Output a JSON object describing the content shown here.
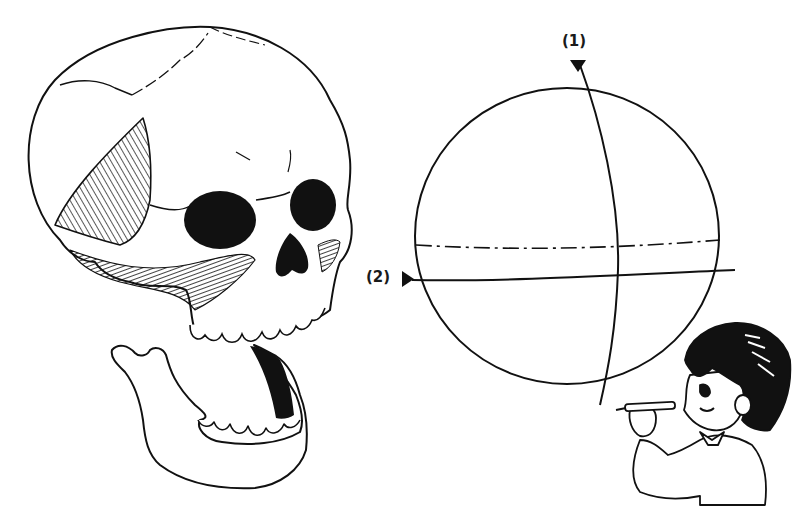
{
  "figure": {
    "type": "illustration",
    "style": "black ink line drawing on white",
    "background": "#ffffff",
    "ink_color": "#111111"
  },
  "labels": {
    "axis1": "(1)",
    "axis2": "(2)"
  },
  "elements": {
    "skull": "human skull, three-quarter view, with open detached jaw",
    "mandible": "lower jaw with teeth, separated below skull",
    "sphere": "circle representing head as a ball with two axis lines",
    "axis1_line": "vertical curved axis marked (1) with downward arrow",
    "axis2_line": "horizontal axis marked (2) with right-pointing arrow",
    "center_line": "dash-dot horizontal line across sphere",
    "character": "cartoon boy with pencil measuring the sphere"
  }
}
